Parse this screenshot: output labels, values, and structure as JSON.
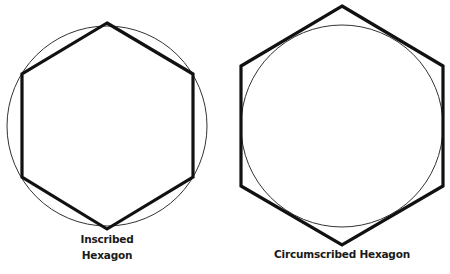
{
  "diagram": {
    "figures": [
      {
        "id": "inscribed",
        "label_lines": [
          "Inscribed",
          "Hexagon"
        ],
        "circle": {
          "cx": 107,
          "cy": 126,
          "r": 100
        },
        "hexagon": {
          "cx": 107,
          "cy": 126,
          "r": 103,
          "orientation": "pointy-top"
        }
      },
      {
        "id": "circumscribed",
        "label_lines": [
          "Circumscribed Hexagon"
        ],
        "circle": {
          "cx": 342,
          "cy": 126,
          "r": 102
        },
        "hexagon": {
          "cx": 342,
          "cy": 126,
          "r": 118,
          "orientation": "pointy-top"
        }
      }
    ],
    "colors": {
      "stroke": "#111111",
      "circle_stroke": "#333333",
      "background": "#ffffff"
    }
  }
}
